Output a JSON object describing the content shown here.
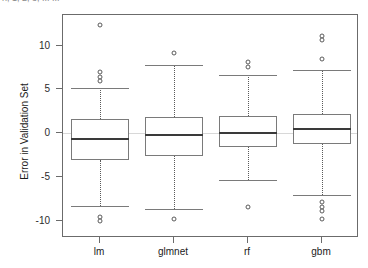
{
  "top_fragment": {
    "text": "n, 1, 2, 3, ... ..."
  },
  "chart_data": {
    "type": "box",
    "title": "",
    "xlabel": "",
    "ylabel": "Error in Validation Set",
    "categories": [
      "lm",
      "glmnet",
      "rf",
      "gbm"
    ],
    "ylim": [
      -12.0,
      13.5
    ],
    "yticks": [
      10,
      5,
      0,
      -5,
      -10
    ],
    "ytick_labels": [
      "10",
      "5",
      "0",
      "-5",
      "-10"
    ],
    "grid": false,
    "legend": "none",
    "reference_line": 0,
    "colors": {
      "frame": "#6b6b6b",
      "box_border": "#7a7a7a",
      "median": "#3a3a3a",
      "whisker": "#5a5a5a",
      "outlier": "#5a5a5a",
      "background": "#ffffff",
      "reference_line": "#d8d8d8"
    },
    "boxes": [
      {
        "category": "lm",
        "q1": -3.1,
        "median": -0.7,
        "q3": 1.6,
        "whisker_low": -8.3,
        "whisker_high": 5.2,
        "outliers": [
          12.3,
          7.0,
          6.4,
          5.9,
          -9.6,
          -10.0
        ]
      },
      {
        "category": "glmnet",
        "q1": -2.6,
        "median": -0.2,
        "q3": 1.8,
        "whisker_low": -8.7,
        "whisker_high": 7.8,
        "outliers": [
          9.1,
          -9.8
        ]
      },
      {
        "category": "rf",
        "q1": -1.6,
        "median": 0.0,
        "q3": 1.9,
        "whisker_low": -5.4,
        "whisker_high": 6.6,
        "outliers": [
          8.1,
          7.6,
          -8.4
        ]
      },
      {
        "category": "gbm",
        "q1": -1.3,
        "median": 0.5,
        "q3": 2.2,
        "whisker_low": -7.1,
        "whisker_high": 7.2,
        "outliers": [
          11.1,
          10.6,
          8.5,
          -7.9,
          -8.4,
          -8.9,
          -9.8
        ]
      }
    ]
  }
}
